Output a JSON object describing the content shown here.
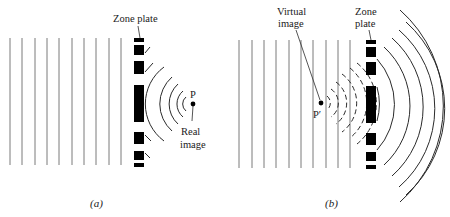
{
  "figure": {
    "panels": [
      {
        "id": "a",
        "caption": "(a)",
        "zone_plate_label": "Zone plate",
        "point_label": "P",
        "point_caption_line1": "Real",
        "point_caption_line2": "image",
        "description": "Plane waves incident on zone plate converge to real image point P"
      },
      {
        "id": "b",
        "caption": "(b)",
        "zone_plate_label_line1": "Zone",
        "zone_plate_label_line2": "plate",
        "point_label": "P′",
        "point_caption_line1": "Virtual",
        "point_caption_line2": "image",
        "description": "Plane waves on zone plate produce diverging waves appearing to come from virtual image P′"
      }
    ],
    "colors": {
      "wavefront": "#7a7a7a",
      "arc": "#2a2a2a",
      "zone_block": "#000000",
      "text": "#1a1a1a"
    }
  }
}
